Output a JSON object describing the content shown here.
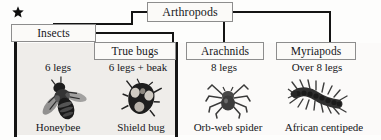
{
  "diagram": {
    "marker_icon": "star-icon",
    "root": {
      "label": "Arthropods"
    },
    "groups": [
      {
        "id": "insects",
        "label": "Insects"
      },
      {
        "id": "true-bugs",
        "label": "True bugs"
      },
      {
        "id": "arachnids",
        "label": "Arachnids"
      },
      {
        "id": "myriapods",
        "label": "Myriapods"
      }
    ],
    "specimens": [
      {
        "id": "honeybee",
        "trait": "6 legs",
        "name": "Honeybee",
        "icon": "honeybee-illustration"
      },
      {
        "id": "shield-bug",
        "trait": "6 legs + beak",
        "name": "Shield bug",
        "icon": "shield-bug-illustration"
      },
      {
        "id": "orb-web-spider",
        "trait": "8 legs",
        "name": "Orb-web spider",
        "icon": "spider-illustration"
      },
      {
        "id": "african-centipede",
        "trait": "Over 8 legs",
        "name": "African centipede",
        "icon": "centipede-illustration"
      }
    ],
    "colors": {
      "line": "#141414",
      "box_border": "#8d8d8d",
      "box_fill": "#fbfaf8",
      "panel_fill": "#efedea",
      "text": "#16161a"
    }
  }
}
